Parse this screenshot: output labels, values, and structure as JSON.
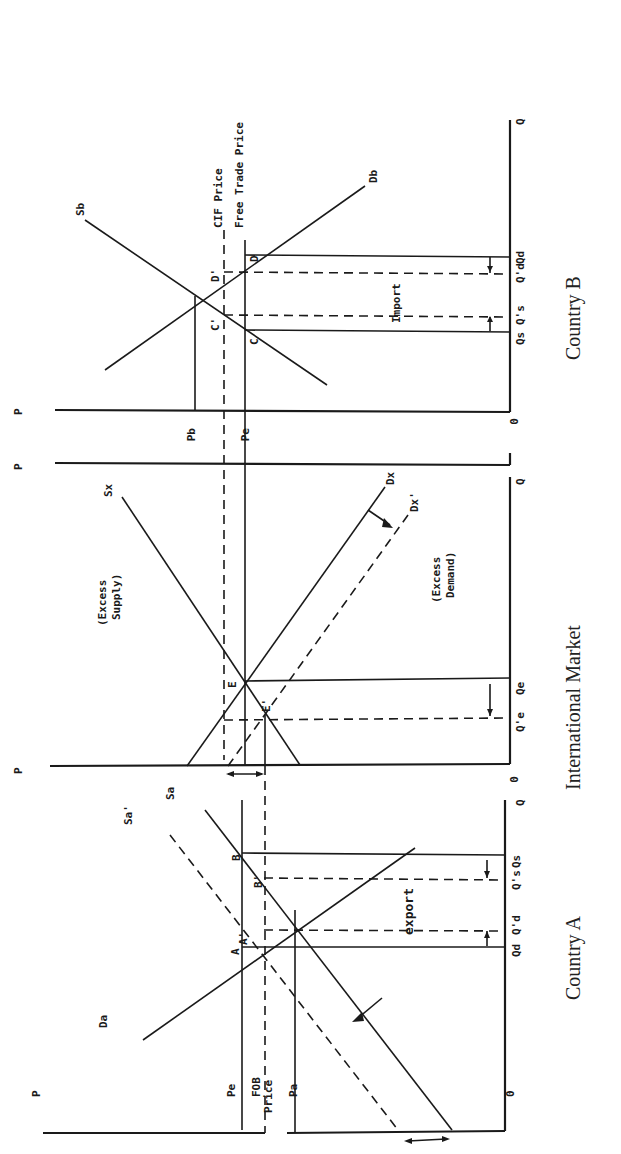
{
  "figure": {
    "orientation": "rotated 90 degrees clockwise",
    "panels": [
      {
        "id": "country_b",
        "title": "Country B",
        "axis_labels": {
          "p": "P",
          "q": "Q",
          "origin": "0"
        },
        "price_labels": {
          "pb": "Pb",
          "pe": "Pe"
        },
        "line_labels": {
          "cif_price": "CIF Price",
          "free_trade_price": "Free Trade Price",
          "supply": "Sb",
          "demand": "Db"
        },
        "point_labels": {
          "d": "D",
          "d_prime": "D'",
          "c": "C",
          "c_prime": "C'"
        },
        "quantity_labels": {
          "qs": "Qs",
          "qs_prime": "Q's",
          "qd_prime": "Q'd",
          "qd": "Qd"
        },
        "annotation": "Import"
      },
      {
        "id": "international_market",
        "title": "International Market",
        "axis_labels": {
          "p": "P",
          "q": "Q",
          "origin": "0"
        },
        "line_labels": {
          "sx": "Sx",
          "dx": "Dx",
          "dx_prime": "Dx'",
          "excess_supply_1": "(Excess",
          "excess_supply_2": "Supply)",
          "excess_demand_1": "(Excess",
          "excess_demand_2": "Demand)"
        },
        "point_labels": {
          "e": "E",
          "e_prime": "E'"
        },
        "quantity_labels": {
          "qe": "Qe",
          "qe_prime": "Q'e"
        }
      },
      {
        "id": "country_a",
        "title": "Country A",
        "axis_labels": {
          "p": "P",
          "q": "Q",
          "origin": "0"
        },
        "price_labels": {
          "pe": "Pe",
          "fob_1": "FOB",
          "fob_2": "Price",
          "pa": "Pa"
        },
        "line_labels": {
          "supply": "Sa",
          "supply_prime": "Sa'",
          "demand": "Da"
        },
        "point_labels": {
          "a": "A",
          "a_prime": "A'",
          "b": "B",
          "b_prime": "B'"
        },
        "quantity_labels": {
          "qd": "Qd",
          "qd_prime": "Q'd",
          "qs_prime": "Q's",
          "qs": "Qs"
        },
        "annotation": "export"
      }
    ]
  }
}
